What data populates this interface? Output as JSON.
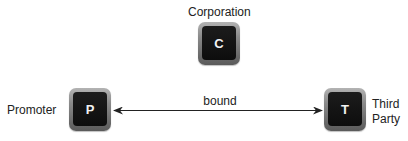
{
  "diagram": {
    "nodes": [
      {
        "id": "C",
        "letter": "C",
        "label": "Corporation"
      },
      {
        "id": "P",
        "letter": "P",
        "label": "Promoter"
      },
      {
        "id": "T",
        "letter": "T",
        "label": "Third Party"
      }
    ],
    "edges": [
      {
        "from": "P",
        "to": "T",
        "label": "bound",
        "direction": "bidirectional"
      }
    ],
    "colors": {
      "node_frame_top": "#b3b3b3",
      "node_frame_bottom": "#5a5a5a",
      "node_inner": "#111111",
      "node_letter": "#f2f2f2",
      "edge": "#222222",
      "text": "#222222"
    }
  }
}
